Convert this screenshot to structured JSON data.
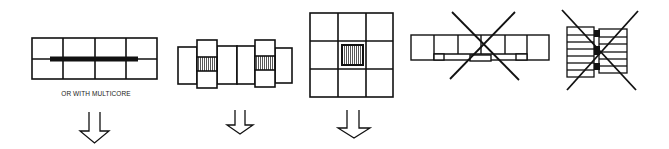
{
  "figures": [
    {
      "id": "fig-1",
      "description": "2x4 grid of boards with a thick multicore bar running horizontally across the middle",
      "caption": "OR WITH MULTICORE",
      "crossed_out": false,
      "has_arrow": true
    },
    {
      "id": "fig-2",
      "description": "Row of panels with two taller blocks each containing a hatched center section",
      "crossed_out": false,
      "has_arrow": true
    },
    {
      "id": "fig-3",
      "description": "3x3 grid with hatched square in the center cell",
      "crossed_out": false,
      "has_arrow": true
    },
    {
      "id": "fig-4",
      "description": "Long single row of panels with small connector blocks underneath",
      "crossed_out": true,
      "has_arrow": false
    },
    {
      "id": "fig-5",
      "description": "Two stacks of horizontal strips joined by black connector blocks",
      "crossed_out": true,
      "has_arrow": false
    }
  ],
  "colors": {
    "line": "#111111",
    "hatch": "#555555",
    "background": "#ffffff"
  }
}
